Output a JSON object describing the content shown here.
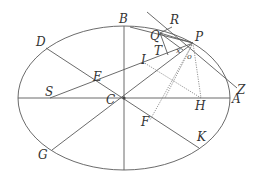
{
  "figure": {
    "colors": {
      "line": "#5a5a5a",
      "text": "#333333",
      "background": "#ffffff"
    },
    "ellipse": {
      "cx": 124,
      "cy": 98,
      "rx": 106,
      "ry": 72
    },
    "labels": {
      "A": "A",
      "B": "B",
      "C": "C",
      "D": "D",
      "E": "E",
      "F": "F",
      "G": "G",
      "H": "H",
      "I": "I",
      "K": "K",
      "P": "P",
      "Q": "Q",
      "R": "R",
      "S": "S",
      "T": "T",
      "Z": "Z",
      "x": "x",
      "o": "o"
    }
  }
}
